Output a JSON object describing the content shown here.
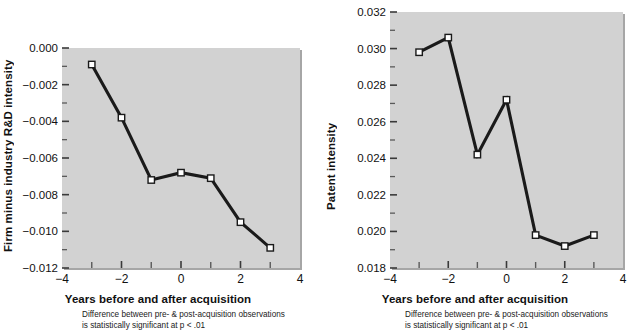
{
  "figure": {
    "background": "#ffffff",
    "plot_background": "#d2d2d2",
    "line_color": "#1a1a1a",
    "marker_fill": "#ffffff",
    "marker_stroke": "#1a1a1a"
  },
  "panels": [
    {
      "id": "rd-intensity",
      "note_line1": "Difference between pre- & post-acquisition observations",
      "note_line2": "is statistically significant at p < .01"
    },
    {
      "id": "patent-intensity",
      "note_line1": "Difference between pre- & post-acquisition observations",
      "note_line2": "is statistically significant at p < .01"
    }
  ],
  "chart_data": [
    {
      "type": "line",
      "title": "",
      "xlabel": "Years before and after acquisition",
      "ylabel": "Firm minus industry R&D intensity",
      "x": [
        -3,
        -2,
        -1,
        0,
        1,
        2,
        3
      ],
      "values": [
        -0.0009,
        -0.0038,
        -0.0072,
        -0.0068,
        -0.0071,
        -0.0095,
        -0.0109
      ],
      "xlim": [
        -4,
        4
      ],
      "ylim": [
        -0.012,
        0.0
      ],
      "xticks": [
        -4,
        -2,
        0,
        2,
        4
      ],
      "xticklabels": [
        "−4",
        "−2",
        "0",
        "2",
        "4"
      ],
      "xminorticks": [
        -3,
        -1,
        1,
        3
      ],
      "yticks": [
        0.0,
        -0.002,
        -0.004,
        -0.006,
        -0.008,
        -0.01,
        -0.012
      ],
      "yticklabels": [
        "0.000",
        "−0.002",
        "−0.004",
        "−0.006",
        "−0.008",
        "−0.010",
        "−0.012"
      ],
      "yminorticks": [
        -0.001,
        -0.003,
        -0.005,
        -0.007,
        -0.009,
        -0.011
      ],
      "grid": false,
      "legend": "none",
      "marker": "square",
      "annotation": "Difference between pre- & post-acquisition observations is statistically significant at p < .01"
    },
    {
      "type": "line",
      "title": "",
      "xlabel": "Years before and after acquisition",
      "ylabel": "Patent intensity",
      "x": [
        -3,
        -2,
        -1,
        0,
        1,
        2,
        3
      ],
      "values": [
        0.0298,
        0.0306,
        0.0242,
        0.0272,
        0.0198,
        0.0192,
        0.0198
      ],
      "xlim": [
        -4,
        4
      ],
      "ylim": [
        0.018,
        0.032
      ],
      "xticks": [
        -4,
        -2,
        0,
        2,
        4
      ],
      "xticklabels": [
        "−4",
        "−2",
        "0",
        "2",
        "4"
      ],
      "xminorticks": [
        -3,
        -1,
        1,
        3
      ],
      "yticks": [
        0.032,
        0.03,
        0.028,
        0.026,
        0.024,
        0.022,
        0.02,
        0.018
      ],
      "yticklabels": [
        "0.032",
        "0.030",
        "0.028",
        "0.026",
        "0.024",
        "0.022",
        "0.020",
        "0.018"
      ],
      "yminorticks": [
        0.031,
        0.029,
        0.027,
        0.025,
        0.023,
        0.021,
        0.019
      ],
      "grid": false,
      "legend": "none",
      "marker": "square",
      "annotation": "Difference between pre- & post-acquisition observations is statistically significant at p < .01"
    }
  ]
}
